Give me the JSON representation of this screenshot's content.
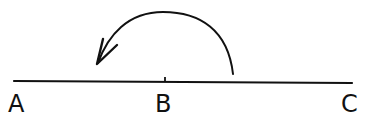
{
  "diagram": {
    "type": "line-segment-with-arc-arrow",
    "stroke_color": "#111111",
    "background": "#ffffff",
    "line": {
      "x1": 14,
      "y1": 81,
      "x2": 352,
      "y2": 83
    },
    "tick": {
      "label": "B",
      "x": 165,
      "y1": 77,
      "y2": 82
    },
    "arc": {
      "path": "M 233 74 C 228 30, 200 12, 163 12 C 128 12, 108 35, 98 63",
      "direction": "from right of B toward A (counter-clockwise)"
    },
    "arrowhead": {
      "tip": [
        97,
        64
      ],
      "barb1": [
        103,
        39
      ],
      "barb2": [
        117,
        45
      ]
    },
    "points": [
      {
        "label": "A",
        "x": 8,
        "y": 92
      },
      {
        "label": "B",
        "x": 155,
        "y": 92
      },
      {
        "label": "C",
        "x": 341,
        "y": 92
      }
    ]
  }
}
